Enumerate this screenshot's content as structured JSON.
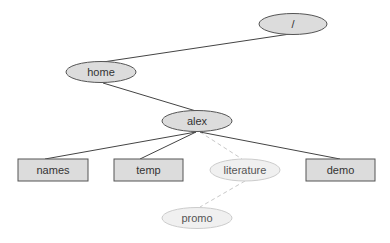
{
  "diagram": {
    "type": "directory-tree",
    "colors": {
      "node_fill": "#dcdcdc",
      "node_stroke": "#555555",
      "dim_fill": "#f0f0f0",
      "dim_stroke": "#c8c8c8",
      "edge": "#444444",
      "dashed_edge": "#c8c8c8"
    },
    "nodes": [
      {
        "id": "root",
        "label": "/",
        "shape": "ellipse",
        "style": "normal"
      },
      {
        "id": "home",
        "label": "home",
        "shape": "ellipse",
        "style": "normal"
      },
      {
        "id": "alex",
        "label": "alex",
        "shape": "ellipse",
        "style": "normal"
      },
      {
        "id": "names",
        "label": "names",
        "shape": "box",
        "style": "normal"
      },
      {
        "id": "temp",
        "label": "temp",
        "shape": "box",
        "style": "normal"
      },
      {
        "id": "literature",
        "label": "literature",
        "shape": "ellipse",
        "style": "dimmed"
      },
      {
        "id": "demo",
        "label": "demo",
        "shape": "box",
        "style": "normal"
      },
      {
        "id": "promo",
        "label": "promo",
        "shape": "ellipse",
        "style": "dimmed"
      }
    ],
    "edges": [
      {
        "from": "root",
        "to": "home",
        "style": "solid"
      },
      {
        "from": "home",
        "to": "alex",
        "style": "solid"
      },
      {
        "from": "alex",
        "to": "names",
        "style": "solid"
      },
      {
        "from": "alex",
        "to": "temp",
        "style": "solid"
      },
      {
        "from": "alex",
        "to": "literature",
        "style": "dashed"
      },
      {
        "from": "alex",
        "to": "demo",
        "style": "solid"
      },
      {
        "from": "literature",
        "to": "promo",
        "style": "dashed"
      }
    ]
  }
}
